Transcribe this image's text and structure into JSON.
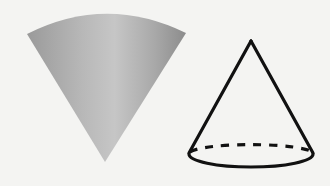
{
  "diagram": {
    "title": "",
    "background": "#f4f4f2",
    "shapes": [
      {
        "id": "shaded-cone",
        "kind": "solid-cone",
        "orientation": "apex-down",
        "apex": [
          105,
          162
        ],
        "top_left": [
          27,
          33
        ],
        "top_right": [
          186,
          33
        ],
        "colors": {
          "light": "#c9c9c9",
          "mid": "#a8a8a8",
          "dark": "#8f8f8f"
        }
      },
      {
        "id": "outline-cone",
        "kind": "wireframe-cone",
        "orientation": "apex-up",
        "apex": [
          251,
          41
        ],
        "base_center": [
          251,
          155
        ],
        "base_rx": 63,
        "base_ry": 11,
        "stroke": "#111111",
        "hidden_edge": "dashed"
      }
    ]
  }
}
